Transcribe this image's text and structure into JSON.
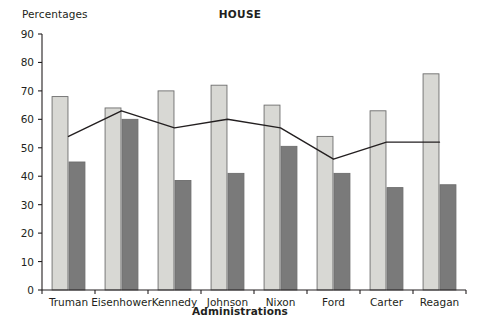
{
  "chart": {
    "title": "HOUSE",
    "y_axis_title": "Percentages",
    "x_axis_title": "Administrations"
  },
  "chart_data": {
    "type": "bar",
    "title": "HOUSE",
    "xlabel": "Administrations",
    "ylabel": "Percentages",
    "ylim": [
      0,
      90
    ],
    "yticks": [
      0,
      10,
      20,
      30,
      40,
      50,
      60,
      70,
      80,
      90
    ],
    "grid": false,
    "legend": "none",
    "categories": [
      "Truman",
      "Eisenhower",
      "Kennedy",
      "Johnson",
      "Nixon",
      "Ford",
      "Carter",
      "Reagan"
    ],
    "series": [
      {
        "name": "light-bar",
        "type": "bar",
        "color": "#d8d8d4",
        "values": [
          68,
          64,
          70,
          72,
          65,
          54,
          63,
          76
        ]
      },
      {
        "name": "dark-bar",
        "type": "bar",
        "color": "#7a7a7a",
        "values": [
          45,
          60,
          38.5,
          41,
          50.5,
          41,
          36,
          37
        ]
      },
      {
        "name": "trend-line",
        "type": "line",
        "color": "#231f20",
        "values": [
          54,
          63,
          57,
          60,
          57,
          46,
          52,
          52
        ]
      }
    ]
  },
  "colors": {
    "light_bar": "#d8d8d4",
    "dark_bar": "#7a7a7a",
    "bar_stroke": "#6d6d6d",
    "axis": "#231f20",
    "line": "#231f20",
    "background": "#ffffff"
  }
}
